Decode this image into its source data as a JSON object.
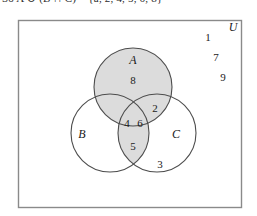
{
  "caption": {
    "text": "So A ∪ (B ∩ C) = {a, 2, 4, 5, 6, 8}"
  },
  "diagram": {
    "universe_label": "U",
    "shading_color": "#dcdcdc",
    "outline_color": "#4d4d4d",
    "border_color": "#8a8a8a",
    "background_color": "#ffffff",
    "sets": [
      {
        "id": "A",
        "label": "A",
        "cx": 133,
        "cy": 79,
        "r": 39,
        "shaded": true
      },
      {
        "id": "B",
        "label": "B",
        "cx": 110,
        "cy": 125,
        "r": 39,
        "shaded": false
      },
      {
        "id": "C",
        "label": "C",
        "cx": 157,
        "cy": 125,
        "r": 39,
        "shaded": false
      }
    ],
    "set_label_positions": [
      {
        "id": "A",
        "x": 133,
        "y": 56
      },
      {
        "id": "B",
        "x": 82,
        "y": 130
      },
      {
        "id": "C",
        "x": 176,
        "y": 130
      }
    ],
    "regions": [
      {
        "id": "A-only",
        "value": "8",
        "x": 133,
        "y": 76,
        "shaded": true
      },
      {
        "id": "A-and-C",
        "value": "2",
        "x": 155,
        "y": 104,
        "shaded": true
      },
      {
        "id": "A-and-B",
        "value": "4",
        "x": 127,
        "y": 119,
        "shaded": true
      },
      {
        "id": "A-B-C",
        "value": "6",
        "x": 140,
        "y": 119,
        "shaded": true
      },
      {
        "id": "B-and-C",
        "value": "5",
        "x": 133,
        "y": 142,
        "shaded": true
      },
      {
        "id": "C-only",
        "value": "3",
        "x": 160,
        "y": 160,
        "shaded": false
      }
    ],
    "outside_numbers": [
      {
        "value": "1",
        "x": 208,
        "y": 33
      },
      {
        "value": "7",
        "x": 216,
        "y": 53
      },
      {
        "value": "9",
        "x": 223,
        "y": 73
      }
    ],
    "universe_label_position": {
      "x": 233,
      "y": 23
    },
    "rectangle": {
      "x": 18,
      "y": 12,
      "width": 224,
      "height": 188
    }
  }
}
